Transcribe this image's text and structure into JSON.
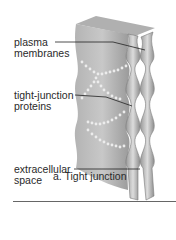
{
  "figure": {
    "labels": [
      {
        "id": "plasma-membranes",
        "text": "plasma\nmembranes"
      },
      {
        "id": "tight-junction-proteins",
        "text": "tight-junction\nproteins"
      },
      {
        "id": "extracellular-space",
        "text": "extracellular\nspace"
      }
    ],
    "caption": "a. Tight junction",
    "colors": {
      "cell_light": "#c9c9c9",
      "cell_mid": "#a8a8a8",
      "cell_dark": "#8a8a8a",
      "protein_dots": "#e8e8e8",
      "leader_lines": "#222222"
    }
  }
}
